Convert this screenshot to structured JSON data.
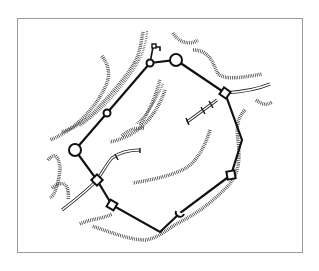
{
  "figure": {
    "type": "fortification-site-plan",
    "style": "black line drawing on white",
    "colors": {
      "line": "#111111",
      "frame": "#9a9a9a",
      "background": "#ffffff"
    },
    "frame": {
      "x": 17,
      "y": 18,
      "width": 286,
      "height": 235
    },
    "wall": {
      "vertices": [
        [
          150,
          63
        ],
        [
          176,
          60
        ],
        [
          225,
          93
        ],
        [
          242,
          140
        ],
        [
          231,
          175
        ],
        [
          180,
          213
        ],
        [
          160,
          232
        ],
        [
          112,
          205
        ],
        [
          97,
          180
        ],
        [
          75,
          150
        ],
        [
          107,
          113
        ],
        [
          150,
          63
        ]
      ]
    },
    "towers": [
      {
        "shape": "circle",
        "x": 150,
        "y": 63,
        "r": 3.5,
        "label": "round-tower"
      },
      {
        "shape": "circle",
        "x": 176,
        "y": 60,
        "r": 6,
        "label": "large-round-tower"
      },
      {
        "shape": "square",
        "x": 225,
        "y": 93,
        "size": 8,
        "label": "corner-tower-ne"
      },
      {
        "shape": "square",
        "x": 231,
        "y": 175,
        "size": 8,
        "label": "corner-tower-se"
      },
      {
        "shape": "semicircle",
        "x": 180,
        "y": 213,
        "r": 4,
        "label": "interval-tower-s"
      },
      {
        "shape": "square",
        "x": 112,
        "y": 205,
        "size": 8,
        "label": "corner-tower-sw"
      },
      {
        "shape": "square",
        "x": 97,
        "y": 180,
        "size": 8,
        "label": "gate-tower-w"
      },
      {
        "shape": "circle",
        "x": 75,
        "y": 150,
        "r": 6,
        "label": "large-round-tower-w"
      },
      {
        "shape": "circle",
        "x": 107,
        "y": 113,
        "r": 3.5,
        "label": "round-tower-nw"
      }
    ],
    "annexes": [
      {
        "label": "north-gate-bastion",
        "path": [
          [
            150,
            63
          ],
          [
            153,
            46
          ],
          [
            160,
            46
          ],
          [
            160,
            50
          ]
        ]
      }
    ],
    "text": []
  }
}
